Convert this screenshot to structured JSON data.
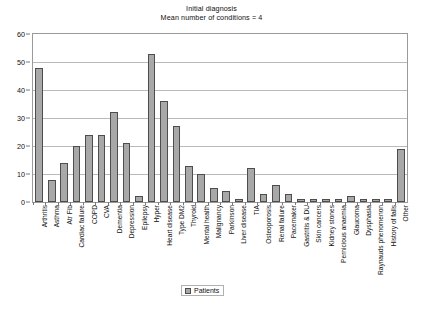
{
  "chart_data": {
    "type": "bar",
    "title": "Initial diagnosis",
    "subtitle": "Mean number of conditions = 4",
    "xlabel": "",
    "ylabel": "",
    "ylim": [
      0,
      60
    ],
    "ytick_step": 10,
    "yticks": [
      0,
      10,
      20,
      30,
      40,
      50,
      60
    ],
    "grid": true,
    "legend_position": "bottom-center",
    "series_name": "Patients",
    "bar_color": "#a8a8a8",
    "bar_border_color": "#4d4d4d",
    "categories": [
      "Arthritis",
      "Asthma",
      "Atr Fib",
      "Cardiac failure",
      "COPD",
      "CVA",
      "Dementia",
      "Depression",
      "Epilepsy",
      "Hyper",
      "Heart disease",
      "Type DM2",
      "Thyroid",
      "Mental health",
      "Malignancy",
      "Parkinson",
      "Liver disease",
      "TIA",
      "Osteoporosis",
      "Renal failure",
      "Pacemaker",
      "Gastritis & DU",
      "Skin cancers",
      "Kidney stones",
      "Pernicious anaemia",
      "Glaucoma",
      "Dysphasia",
      "Raynauds phenomenon",
      "History of falls",
      "Other"
    ],
    "values": [
      48,
      8,
      14,
      20,
      24,
      24,
      32,
      21,
      2,
      53,
      36,
      27,
      13,
      10,
      5,
      4,
      1,
      12,
      3,
      6,
      3,
      1,
      1,
      1,
      1,
      2,
      1,
      1,
      1,
      19
    ]
  },
  "legend": {
    "label": "Patients"
  }
}
